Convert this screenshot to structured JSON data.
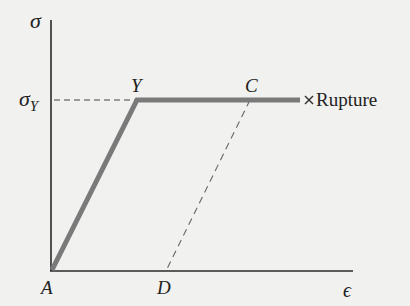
{
  "diagram": {
    "axes": {
      "y_label": "σ",
      "x_label": "ϵ"
    },
    "yield_label": "σ",
    "yield_subscript": "Y",
    "points": {
      "A": "A",
      "Y": "Y",
      "C": "C",
      "D": "D"
    },
    "rupture_marker": "×",
    "rupture_label": "Rupture",
    "colors": {
      "curve": "#7a7a7a",
      "axes": "#2a2a2a",
      "dashed": "#555555",
      "background": "#f1f1ef"
    }
  }
}
